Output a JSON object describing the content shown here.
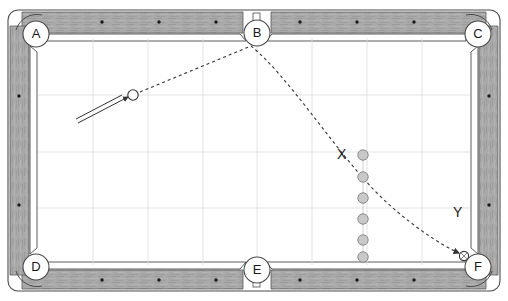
{
  "diagram": {
    "table": {
      "rail_color": "#a9a9a9",
      "rail_dark_color": "#8a8a8a",
      "cloth_color": "#ffffff",
      "grid_color": "#d8d8d8",
      "outline_color": "#555555",
      "grid_columns": 8,
      "grid_rows": 3
    },
    "pockets": [
      {
        "id": "A",
        "label": "A",
        "position": "top-left",
        "cx": 36,
        "cy": 34
      },
      {
        "id": "B",
        "label": "B",
        "position": "top-center",
        "cx": 257,
        "cy": 33
      },
      {
        "id": "C",
        "label": "C",
        "position": "top-right",
        "cx": 478,
        "cy": 34
      },
      {
        "id": "D",
        "label": "D",
        "position": "bottom-left",
        "cx": 36,
        "cy": 267
      },
      {
        "id": "E",
        "label": "E",
        "position": "bottom-center",
        "cx": 257,
        "cy": 270
      },
      {
        "id": "F",
        "label": "F",
        "position": "bottom-right",
        "cx": 478,
        "cy": 267
      }
    ],
    "rail_dots": {
      "top": [
        {
          "x": 102
        },
        {
          "x": 159
        },
        {
          "x": 216
        },
        {
          "x": 300
        },
        {
          "x": 357
        },
        {
          "x": 414
        }
      ],
      "bottom": [
        {
          "x": 102
        },
        {
          "x": 159
        },
        {
          "x": 216
        },
        {
          "x": 300
        },
        {
          "x": 357
        },
        {
          "x": 414
        }
      ],
      "left": [
        {
          "y": 96
        },
        {
          "y": 205
        }
      ],
      "right": [
        {
          "y": 96
        },
        {
          "y": 205
        }
      ]
    },
    "cue_ball": {
      "name": "cue-ball",
      "cx": 133,
      "cy": 95,
      "r": 5.2,
      "fill": "#ffffff",
      "stroke": "#333333"
    },
    "cue_stick": {
      "name": "cue-stick",
      "x1": 78,
      "y1": 122,
      "x2": 126,
      "y2": 98
    },
    "object_ball": {
      "name": "object-ball-at-pocket",
      "cx": 464,
      "cy": 256,
      "r": 4.6,
      "fill": "#ffffff",
      "stroke": "#333333"
    },
    "ball_column": {
      "label": "X",
      "cx": 363,
      "fill": "#c9c9c9",
      "stroke": "#8a8a8a",
      "r": 5.2,
      "balls": [
        {
          "cy": 155
        },
        {
          "cy": 177
        },
        {
          "cy": 198
        },
        {
          "cy": 219
        },
        {
          "cy": 240
        },
        {
          "cy": 256
        }
      ]
    },
    "markers": [
      {
        "id": "X",
        "label": "X",
        "x": 341,
        "y": 148,
        "desc": "ball-line-marker-x"
      },
      {
        "id": "Y",
        "label": "Y",
        "x": 456,
        "y": 207,
        "desc": "trajectory-marker-y"
      }
    ],
    "trajectory": {
      "name": "ball-path",
      "style": "dashed",
      "color": "#333333",
      "description": "Curved dashed path from cue ball up to pocket B then sweeping down to pocket F",
      "path": "M 140 92 L 251 46 C 285 72 330 140 372 185 C 400 215 440 243 461 253"
    },
    "footer_note": ""
  }
}
